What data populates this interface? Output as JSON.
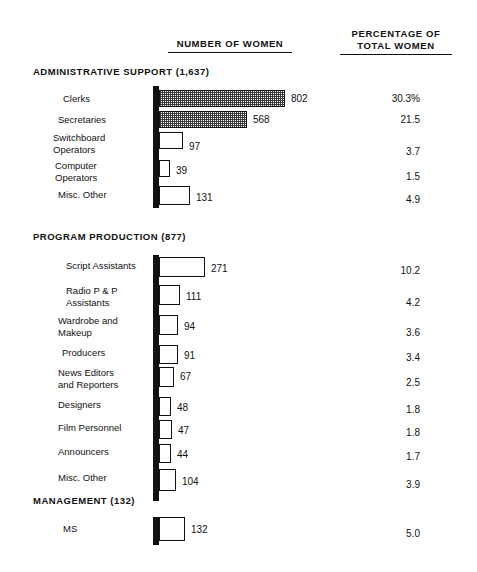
{
  "headers": {
    "number_of_women": "NUMBER OF WOMEN",
    "percentage_of_total_women": "PERCENTAGE OF\nTOTAL WOMEN"
  },
  "chart_data": {
    "type": "bar",
    "title": "",
    "xlabel": "NUMBER OF WOMEN",
    "ylabel": "",
    "orientation": "horizontal",
    "grid": false,
    "legend": "none",
    "xlim": [
      0,
      802
    ],
    "value_columns": [
      "NUMBER OF WOMEN",
      "PERCENTAGE OF TOTAL WOMEN"
    ],
    "groups": [
      {
        "name": "ADMINISTRATIVE SUPPORT",
        "total": "1,637",
        "title": "ADMINISTRATIVE SUPPORT (1,637)",
        "categories": [
          "Clerks",
          "Secretaries",
          "Switchboard\nOperators",
          "Computer\nOperators",
          "Misc. Other"
        ],
        "values": [
          802,
          568,
          97,
          39,
          131
        ],
        "value_labels": [
          "802",
          "568",
          "97",
          "39",
          "131"
        ],
        "percentages": [
          30.3,
          21.5,
          3.7,
          1.5,
          4.9
        ],
        "percentage_labels": [
          "30.3%",
          "21.5",
          "3.7",
          "1.5",
          "4.9"
        ],
        "fills": [
          "hatched",
          "hatched",
          "white",
          "white",
          "white"
        ]
      },
      {
        "name": "PROGRAM PRODUCTION",
        "total": "877",
        "title": "PROGRAM PRODUCTION (877)",
        "categories": [
          "Script Assistants",
          "Radio P & P\nAssistants",
          "Wardrobe and\nMakeup",
          "Producers",
          "News Editors\nand Reporters",
          "Designers",
          "Film Personnel",
          "Announcers",
          "Misc. Other"
        ],
        "values": [
          271,
          111,
          94,
          91,
          67,
          48,
          47,
          44,
          104
        ],
        "value_labels": [
          "271",
          "111",
          "94",
          "91",
          "67",
          "48",
          "47",
          "44",
          "104"
        ],
        "percentages": [
          10.2,
          4.2,
          3.6,
          3.4,
          2.5,
          1.8,
          1.8,
          1.7,
          3.9
        ],
        "percentage_labels": [
          "10.2",
          "4.2",
          "3.6",
          "3.4",
          "2.5",
          "1.8",
          "1.8",
          "1.7",
          "3.9"
        ],
        "fills": [
          "white",
          "white",
          "white",
          "white",
          "white",
          "white",
          "white",
          "white",
          "white"
        ]
      },
      {
        "name": "MANAGEMENT",
        "total": "132",
        "title": "MANAGEMENT (132)",
        "categories": [
          "MS"
        ],
        "values": [
          132
        ],
        "value_labels": [
          "132"
        ],
        "percentages": [
          5.0
        ],
        "percentage_labels": [
          "5.0"
        ],
        "fills": [
          "white"
        ]
      }
    ]
  },
  "layout": {
    "sections": [
      {
        "top": 66,
        "title_top": 0,
        "spine_top": 20,
        "spine_height": 122,
        "rows": [
          {
            "top": 24,
            "label_left": 63,
            "label_top": 3,
            "bar_w": 126,
            "bar_h": 17,
            "val_top": 3,
            "pct_top": 3
          },
          {
            "top": 45,
            "label_left": 58,
            "label_top": 3,
            "bar_w": 88,
            "bar_h": 17,
            "val_top": 3,
            "pct_top": 3
          },
          {
            "top": 66,
            "label_left": 53,
            "label_top": 0,
            "bar_w": 24,
            "bar_h": 17,
            "val_top": 9,
            "pct_top": 14
          },
          {
            "top": 94,
            "label_left": 55,
            "label_top": 0,
            "bar_w": 11,
            "bar_h": 17,
            "val_top": 5,
            "pct_top": 11
          },
          {
            "top": 120,
            "label_left": 58,
            "label_top": 3,
            "bar_w": 31,
            "bar_h": 19,
            "val_top": 6,
            "pct_top": 8
          }
        ]
      },
      {
        "top": 231,
        "title_top": 0,
        "spine_top": 24,
        "spine_height": 246,
        "rows": [
          {
            "top": 26,
            "label_left": 66,
            "label_top": 3,
            "bar_w": 46,
            "bar_h": 20,
            "val_top": 6,
            "pct_top": 8
          },
          {
            "top": 54,
            "label_left": 66,
            "label_top": 0,
            "bar_w": 21,
            "bar_h": 20,
            "val_top": 6,
            "pct_top": 12
          },
          {
            "top": 84,
            "label_left": 58,
            "label_top": 0,
            "bar_w": 19,
            "bar_h": 20,
            "val_top": 6,
            "pct_top": 12
          },
          {
            "top": 114,
            "label_left": 62,
            "label_top": 2,
            "bar_w": 19,
            "bar_h": 19,
            "val_top": 5,
            "pct_top": 7
          },
          {
            "top": 136,
            "label_left": 58,
            "label_top": 0,
            "bar_w": 15,
            "bar_h": 20,
            "val_top": 4,
            "pct_top": 10
          },
          {
            "top": 166,
            "label_left": 58,
            "label_top": 2,
            "bar_w": 12,
            "bar_h": 19,
            "val_top": 5,
            "pct_top": 7
          },
          {
            "top": 189,
            "label_left": 58,
            "label_top": 2,
            "bar_w": 13,
            "bar_h": 19,
            "val_top": 5,
            "pct_top": 7
          },
          {
            "top": 213,
            "label_left": 58,
            "label_top": 2,
            "bar_w": 12,
            "bar_h": 19,
            "val_top": 5,
            "pct_top": 7
          },
          {
            "top": 238,
            "label_left": 58,
            "label_top": 3,
            "bar_w": 17,
            "bar_h": 22,
            "val_top": 7,
            "pct_top": 10
          }
        ]
      },
      {
        "top": 495,
        "title_top": 0,
        "spine_top": 22,
        "spine_height": 28,
        "rows": [
          {
            "top": 22,
            "label_left": 63,
            "label_top": 6,
            "bar_w": 26,
            "bar_h": 24,
            "val_top": 7,
            "pct_top": 11
          }
        ]
      }
    ]
  }
}
